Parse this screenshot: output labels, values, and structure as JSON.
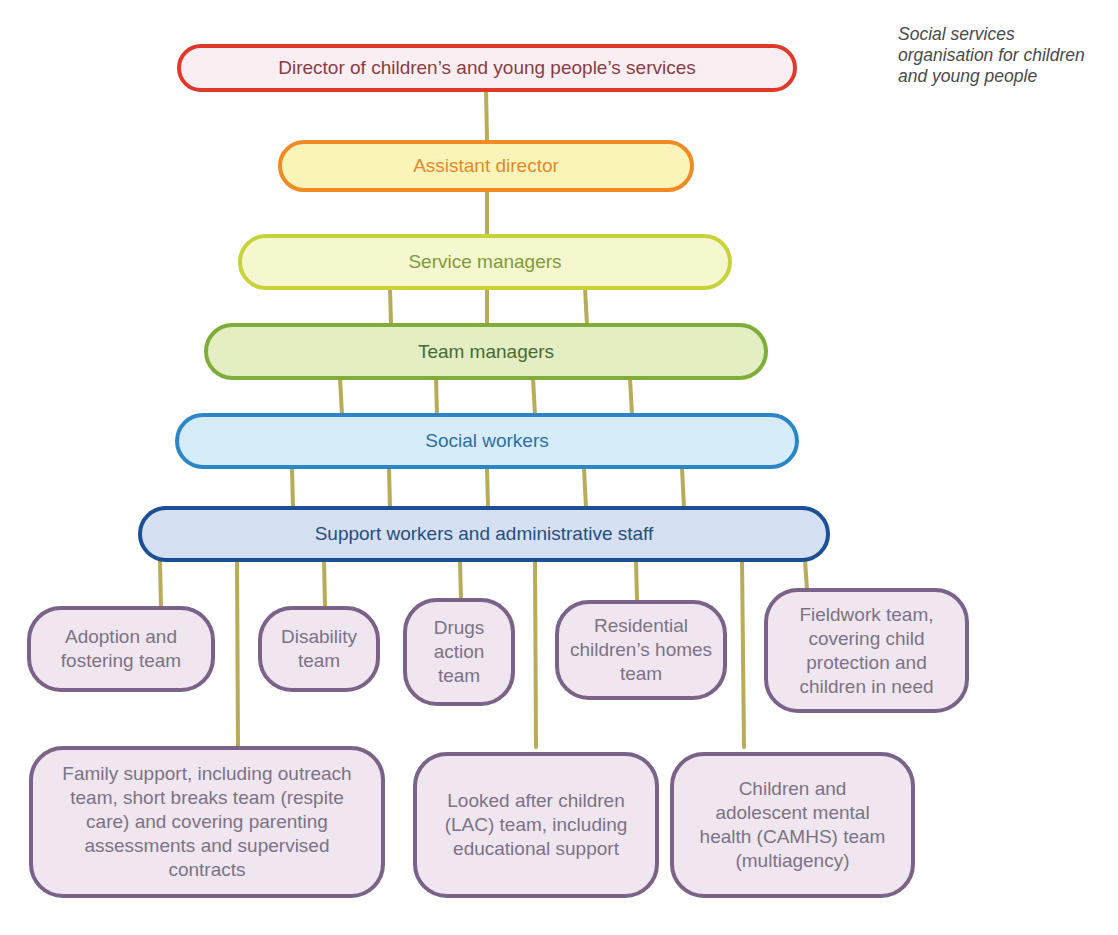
{
  "caption": "Social services organisation for children and young people",
  "tiers": [
    {
      "id": "director",
      "label": "Director of children’s and young people’s services",
      "border_color": "#e0392b",
      "fill_color": "#f9eff2",
      "text_color": "#8a3b45"
    },
    {
      "id": "assistant-director",
      "label": "Assistant director",
      "border_color": "#ef8a24",
      "fill_color": "#fbf4b8",
      "text_color": "#e3892c"
    },
    {
      "id": "service-managers",
      "label": "Service managers",
      "border_color": "#c6d43a",
      "fill_color": "#f5f7cf",
      "text_color": "#7f9a3b"
    },
    {
      "id": "team-managers",
      "label": "Team managers",
      "border_color": "#7fad3a",
      "fill_color": "#e3eec2",
      "text_color": "#4a6a35"
    },
    {
      "id": "social-workers",
      "label": "Social workers",
      "border_color": "#2b86c8",
      "fill_color": "#d6ecf8",
      "text_color": "#2d6fa4"
    },
    {
      "id": "support-workers",
      "label": "Support workers and administrative staff",
      "border_color": "#1d4f95",
      "fill_color": "#d5e1f2",
      "text_color": "#2a4d7d"
    }
  ],
  "teams": [
    {
      "id": "adoption-fostering",
      "label": "Adoption and fostering team"
    },
    {
      "id": "disability",
      "label": "Disability team"
    },
    {
      "id": "drugs-action",
      "label": "Drugs action team"
    },
    {
      "id": "residential-homes",
      "label": "Residential children’s homes team"
    },
    {
      "id": "fieldwork",
      "label": "Fieldwork team, covering child protection and children in need"
    },
    {
      "id": "family-support",
      "label": "Family support, including outreach team, short breaks team (respite care) and covering parenting assessments and supervised contracts"
    },
    {
      "id": "looked-after-children",
      "label": "Looked after children (LAC) team, including educational support"
    },
    {
      "id": "camhs",
      "label": "Children and adolescent mental health (CAMHS) team (multiagency)"
    }
  ],
  "connector_color": "#b8ab5a",
  "team_border_color": "#7b6288",
  "team_fill_color": "#efe6f0"
}
